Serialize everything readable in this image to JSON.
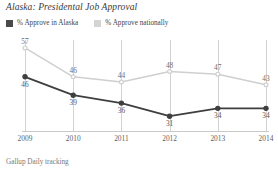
{
  "title": "Alaska: Presidental Job Approval",
  "footer": "Gallup Daily tracking",
  "legend": {
    "items": [
      {
        "label": "% Approve in Alaska",
        "color": "#4a4a4a",
        "swatch_name": "legend-swatch-alaska"
      },
      {
        "label": "% Approve nationally",
        "color": "#d0d0d0",
        "swatch_name": "legend-swatch-national"
      }
    ]
  },
  "chart_data": {
    "type": "line",
    "title": "Alaska: Presidental Job Approval",
    "xlabel": "",
    "ylabel": "",
    "categories": [
      "2009",
      "2010",
      "2011",
      "2012",
      "2013",
      "2014"
    ],
    "x": [
      2009,
      2010,
      2011,
      2012,
      2013,
      2014
    ],
    "ylim": [
      25,
      60
    ],
    "grid": "vertical",
    "legend_position": "top-left",
    "series": [
      {
        "name": "% Approve in Alaska",
        "color": "#3f3f3f",
        "values": [
          46,
          39,
          36,
          31,
          34,
          34
        ],
        "label_positions": [
          "below",
          "below",
          "below",
          "below",
          "below",
          "below"
        ]
      },
      {
        "name": "% Approve nationally",
        "color": "#cfcfcf",
        "values": [
          57,
          46,
          44,
          48,
          47,
          43
        ],
        "label_positions": [
          "above",
          "above",
          "above",
          "above",
          "above",
          "above"
        ]
      }
    ],
    "source": "Gallup Daily tracking"
  }
}
